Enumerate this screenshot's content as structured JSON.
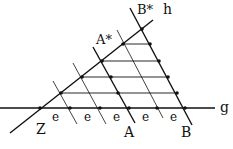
{
  "diagram": {
    "labels": {
      "Z": "Z",
      "A": "A",
      "B": "B",
      "A_star": "A*",
      "B_star": "B*",
      "g": "g",
      "h": "h",
      "e": "e"
    },
    "colors": {
      "stroke": "#111111",
      "background": "#ffffff"
    }
  }
}
